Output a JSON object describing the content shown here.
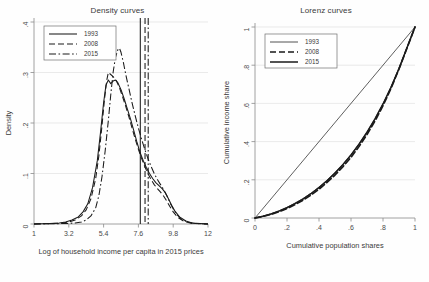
{
  "figure": {
    "panels": [
      "density",
      "lorenz"
    ]
  },
  "chart_data": [
    {
      "type": "line",
      "id": "density-curves",
      "title": "Density curves",
      "xlabel": "Log of household income per capita in 2015 prices",
      "ylabel": "Density",
      "xlim": [
        1,
        12
      ],
      "ylim": [
        0,
        0.4
      ],
      "xticks": [
        "1",
        "3.2",
        "5.4",
        "7.6",
        "9.8",
        "12"
      ],
      "xtick_values": [
        1,
        3.2,
        5.4,
        7.6,
        9.8,
        12
      ],
      "yticks": [
        "0",
        ".1",
        ".2",
        ".3",
        ".4"
      ],
      "ytick_values": [
        0,
        0.1,
        0.2,
        0.3,
        0.4
      ],
      "grid": "horizontal",
      "legend_position": "top-left",
      "legend": [
        "1993",
        "2008",
        "2015"
      ],
      "series": [
        {
          "name": "1993",
          "style": "solid",
          "points": [
            [
              1.0,
              0.0
            ],
            [
              2.0,
              0.001
            ],
            [
              2.6,
              0.002
            ],
            [
              3.0,
              0.004
            ],
            [
              3.4,
              0.008
            ],
            [
              3.8,
              0.014
            ],
            [
              4.1,
              0.024
            ],
            [
              4.4,
              0.04
            ],
            [
              4.7,
              0.072
            ],
            [
              5.0,
              0.125
            ],
            [
              5.2,
              0.18
            ],
            [
              5.4,
              0.24
            ],
            [
              5.55,
              0.275
            ],
            [
              5.7,
              0.285
            ],
            [
              5.85,
              0.278
            ],
            [
              6.0,
              0.283
            ],
            [
              6.15,
              0.285
            ],
            [
              6.3,
              0.28
            ],
            [
              6.5,
              0.266
            ],
            [
              6.7,
              0.248
            ],
            [
              6.9,
              0.228
            ],
            [
              7.1,
              0.208
            ],
            [
              7.3,
              0.186
            ],
            [
              7.5,
              0.163
            ],
            [
              7.7,
              0.142
            ],
            [
              7.9,
              0.126
            ],
            [
              8.1,
              0.112
            ],
            [
              8.3,
              0.1
            ],
            [
              8.5,
              0.09
            ],
            [
              8.7,
              0.082
            ],
            [
              8.9,
              0.076
            ],
            [
              9.1,
              0.07
            ],
            [
              9.3,
              0.062
            ],
            [
              9.5,
              0.05
            ],
            [
              9.7,
              0.037
            ],
            [
              9.9,
              0.026
            ],
            [
              10.2,
              0.014
            ],
            [
              10.6,
              0.006
            ],
            [
              11.0,
              0.002
            ],
            [
              12.0,
              0.0
            ]
          ]
        },
        {
          "name": "2008",
          "style": "dashed",
          "points": [
            [
              1.0,
              0.0
            ],
            [
              2.2,
              0.001
            ],
            [
              2.8,
              0.002
            ],
            [
              3.2,
              0.004
            ],
            [
              3.6,
              0.008
            ],
            [
              4.0,
              0.016
            ],
            [
              4.3,
              0.028
            ],
            [
              4.6,
              0.05
            ],
            [
              4.9,
              0.09
            ],
            [
              5.1,
              0.135
            ],
            [
              5.3,
              0.195
            ],
            [
              5.45,
              0.245
            ],
            [
              5.6,
              0.285
            ],
            [
              5.7,
              0.3
            ],
            [
              5.85,
              0.296
            ],
            [
              6.0,
              0.292
            ],
            [
              6.2,
              0.284
            ],
            [
              6.4,
              0.27
            ],
            [
              6.6,
              0.252
            ],
            [
              6.8,
              0.233
            ],
            [
              7.0,
              0.212
            ],
            [
              7.2,
              0.19
            ],
            [
              7.4,
              0.168
            ],
            [
              7.6,
              0.148
            ],
            [
              7.8,
              0.13
            ],
            [
              8.0,
              0.114
            ],
            [
              8.2,
              0.1
            ],
            [
              8.4,
              0.088
            ],
            [
              8.6,
              0.078
            ],
            [
              8.8,
              0.07
            ],
            [
              9.0,
              0.063
            ],
            [
              9.2,
              0.055
            ],
            [
              9.4,
              0.045
            ],
            [
              9.6,
              0.034
            ],
            [
              9.8,
              0.024
            ],
            [
              10.1,
              0.013
            ],
            [
              10.5,
              0.005
            ],
            [
              11.0,
              0.001
            ],
            [
              12.0,
              0.0
            ]
          ]
        },
        {
          "name": "2015",
          "style": "dash-dot",
          "points": [
            [
              1.0,
              0.0
            ],
            [
              3.0,
              0.001
            ],
            [
              3.6,
              0.002
            ],
            [
              4.0,
              0.004
            ],
            [
              4.3,
              0.008
            ],
            [
              4.6,
              0.016
            ],
            [
              4.9,
              0.032
            ],
            [
              5.1,
              0.056
            ],
            [
              5.3,
              0.094
            ],
            [
              5.5,
              0.145
            ],
            [
              5.7,
              0.205
            ],
            [
              5.85,
              0.255
            ],
            [
              6.0,
              0.3
            ],
            [
              6.15,
              0.33
            ],
            [
              6.3,
              0.345
            ],
            [
              6.4,
              0.348
            ],
            [
              6.5,
              0.34
            ],
            [
              6.65,
              0.32
            ],
            [
              6.8,
              0.296
            ],
            [
              7.0,
              0.268
            ],
            [
              7.2,
              0.24
            ],
            [
              7.4,
              0.214
            ],
            [
              7.6,
              0.19
            ],
            [
              7.8,
              0.168
            ],
            [
              8.0,
              0.148
            ],
            [
              8.2,
              0.13
            ],
            [
              8.4,
              0.114
            ],
            [
              8.6,
              0.1
            ],
            [
              8.8,
              0.088
            ],
            [
              9.0,
              0.078
            ],
            [
              9.2,
              0.068
            ],
            [
              9.4,
              0.056
            ],
            [
              9.6,
              0.042
            ],
            [
              9.8,
              0.03
            ],
            [
              10.0,
              0.02
            ],
            [
              10.3,
              0.01
            ],
            [
              10.7,
              0.004
            ],
            [
              11.2,
              0.001
            ],
            [
              12.0,
              0.0
            ]
          ]
        }
      ],
      "vertical_lines": [
        {
          "name": "mean-1993",
          "x": 7.72,
          "style": "solid"
        },
        {
          "name": "mean-2008",
          "x": 8.02,
          "style": "dashed"
        },
        {
          "name": "mean-2015",
          "x": 8.22,
          "style": "dash-dot"
        }
      ]
    },
    {
      "type": "line",
      "id": "lorenz-curves",
      "title": "Lorenz curves",
      "xlabel": "Cumulative population shares",
      "ylabel": "Cumulative income share",
      "xlim": [
        0,
        1
      ],
      "ylim": [
        0,
        1
      ],
      "xticks": [
        "0",
        ".2",
        ".4",
        ".6",
        ".8",
        "1"
      ],
      "xtick_values": [
        0,
        0.2,
        0.4,
        0.6,
        0.8,
        1
      ],
      "yticks": [
        "0",
        ".2",
        ".4",
        ".6",
        ".8",
        "1"
      ],
      "ytick_values": [
        0,
        0.2,
        0.4,
        0.6,
        0.8,
        1
      ],
      "grid": "horizontal",
      "legend_position": "top-left",
      "legend": [
        "1993",
        "2008",
        "2015"
      ],
      "equality_line": [
        [
          0,
          0
        ],
        [
          1,
          1
        ]
      ],
      "series": [
        {
          "name": "1993",
          "style": "thin-solid",
          "points": [
            [
              0.0,
              0.0
            ],
            [
              0.05,
              0.01
            ],
            [
              0.1,
              0.022
            ],
            [
              0.15,
              0.038
            ],
            [
              0.2,
              0.056
            ],
            [
              0.25,
              0.078
            ],
            [
              0.3,
              0.102
            ],
            [
              0.35,
              0.13
            ],
            [
              0.4,
              0.162
            ],
            [
              0.45,
              0.198
            ],
            [
              0.5,
              0.238
            ],
            [
              0.55,
              0.282
            ],
            [
              0.6,
              0.332
            ],
            [
              0.65,
              0.388
            ],
            [
              0.7,
              0.45
            ],
            [
              0.75,
              0.52
            ],
            [
              0.8,
              0.598
            ],
            [
              0.85,
              0.686
            ],
            [
              0.9,
              0.784
            ],
            [
              0.95,
              0.892
            ],
            [
              1.0,
              1.0
            ]
          ]
        },
        {
          "name": "2008",
          "style": "thick-dashed",
          "points": [
            [
              0.0,
              0.0
            ],
            [
              0.05,
              0.008
            ],
            [
              0.1,
              0.019
            ],
            [
              0.15,
              0.033
            ],
            [
              0.2,
              0.05
            ],
            [
              0.25,
              0.07
            ],
            [
              0.3,
              0.093
            ],
            [
              0.35,
              0.12
            ],
            [
              0.4,
              0.151
            ],
            [
              0.45,
              0.186
            ],
            [
              0.5,
              0.225
            ],
            [
              0.55,
              0.269
            ],
            [
              0.6,
              0.318
            ],
            [
              0.65,
              0.374
            ],
            [
              0.7,
              0.437
            ],
            [
              0.75,
              0.508
            ],
            [
              0.8,
              0.588
            ],
            [
              0.85,
              0.679
            ],
            [
              0.9,
              0.78
            ],
            [
              0.95,
              0.89
            ],
            [
              1.0,
              1.0
            ]
          ]
        },
        {
          "name": "2015",
          "style": "thick-solid",
          "points": [
            [
              0.0,
              0.0
            ],
            [
              0.05,
              0.009
            ],
            [
              0.1,
              0.021
            ],
            [
              0.15,
              0.036
            ],
            [
              0.2,
              0.054
            ],
            [
              0.25,
              0.075
            ],
            [
              0.3,
              0.099
            ],
            [
              0.35,
              0.127
            ],
            [
              0.4,
              0.159
            ],
            [
              0.45,
              0.195
            ],
            [
              0.5,
              0.235
            ],
            [
              0.55,
              0.28
            ],
            [
              0.6,
              0.33
            ],
            [
              0.65,
              0.386
            ],
            [
              0.7,
              0.449
            ],
            [
              0.75,
              0.519
            ],
            [
              0.8,
              0.597
            ],
            [
              0.85,
              0.684
            ],
            [
              0.9,
              0.782
            ],
            [
              0.95,
              0.891
            ],
            [
              1.0,
              1.0
            ]
          ]
        }
      ]
    }
  ]
}
